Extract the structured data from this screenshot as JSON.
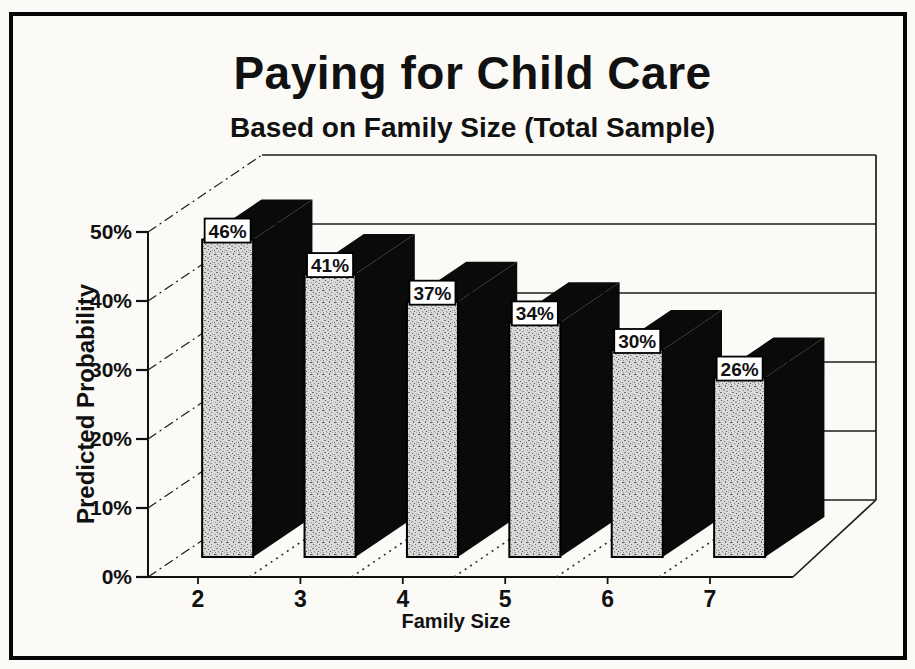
{
  "page": {
    "background": "#fbfaf6",
    "frame_border_color": "#060606"
  },
  "chart_data": {
    "type": "bar",
    "projection": "3d-oblique",
    "title": "Paying for Child Care",
    "subtitle": "Based on Family Size (Total Sample)",
    "xlabel": "Family Size",
    "ylabel": "Predicted Probability",
    "categories": [
      "2",
      "3",
      "4",
      "5",
      "6",
      "7"
    ],
    "values": [
      46,
      41,
      37,
      34,
      30,
      26
    ],
    "value_labels": [
      "46%",
      "41%",
      "37%",
      "34%",
      "30%",
      "26%"
    ],
    "series": [
      {
        "name": "Predicted Probability",
        "values": [
          46,
          41,
          37,
          34,
          30,
          26
        ]
      }
    ],
    "ylim": [
      0,
      50
    ],
    "yticks": [
      {
        "value": 0,
        "label": "0%"
      },
      {
        "value": 10,
        "label": "10%"
      },
      {
        "value": 20,
        "label": "20%"
      },
      {
        "value": 30,
        "label": "30%"
      },
      {
        "value": 40,
        "label": "40%"
      },
      {
        "value": 50,
        "label": "50%"
      }
    ],
    "grid": true,
    "legend": false,
    "colors": {
      "ink": "#111111",
      "line": "#1c1c1c",
      "bar_front": "#d9d9d9",
      "bar_side": "#0a0a0a",
      "label_box_bg": "#ffffff",
      "wall": "#fbfaf6"
    }
  }
}
